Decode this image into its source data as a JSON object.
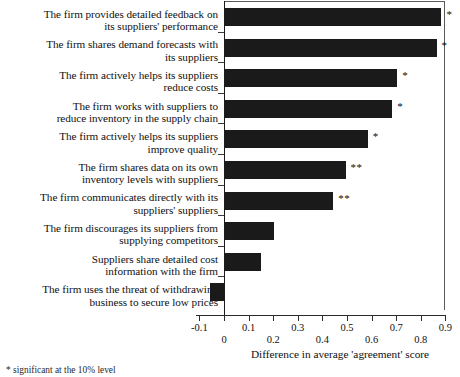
{
  "chart_data": {
    "type": "bar",
    "orientation": "horizontal",
    "title": "",
    "xlabel": "Difference in average 'agreement' score",
    "ylabel": "",
    "xlim": [
      -0.1,
      0.9
    ],
    "xticks": [
      -0.1,
      0,
      0.1,
      0.2,
      0.3,
      0.4,
      0.5,
      0.6,
      0.7,
      0.8,
      0.9
    ],
    "xticklabels": [
      "-0.1",
      "0",
      "0.1",
      "0.2",
      "0.3",
      "0.4",
      "0.5",
      "0.6",
      "0.7",
      "0.8",
      "0.9"
    ],
    "grid": false,
    "legend": null,
    "categories": [
      "The firm provides detailed feedback on its suppliers' performance",
      "The firm shares demand forecasts with its suppliers",
      "The firm actively helps its suppliers reduce costs",
      "The firm works with suppliers to reduce inventory in the supply chain",
      "The firm actively helps its suppliers improve quality",
      "The firm shares data on its own inventory levels with suppliers",
      "The firm communicates directly with its suppliers' suppliers",
      "The firm discourages its suppliers from supplying competitors",
      "Suppliers share detailed cost information with the firm",
      "The firm uses the threat of withdrawing business to secure low prices"
    ],
    "category_lines": [
      [
        "The firm provides detailed feedback on",
        "its suppliers' performance"
      ],
      [
        "The firm shares demand forecasts with",
        "its suppliers"
      ],
      [
        "The firm actively helps its suppliers",
        "reduce costs"
      ],
      [
        "The firm works with suppliers to",
        "reduce inventory in the supply chain"
      ],
      [
        "The firm actively helps its suppliers",
        "improve quality"
      ],
      [
        "The firm shares data on its own",
        "inventory levels with suppliers"
      ],
      [
        "The firm communicates directly with its",
        "suppliers' suppliers"
      ],
      [
        "The firm discourages its suppliers from",
        "supplying competitors"
      ],
      [
        "Suppliers share detailed cost",
        "information with the firm"
      ],
      [
        "The firm uses the threat of withdrawing",
        "business to secure low prices"
      ]
    ],
    "values": [
      0.88,
      0.86,
      0.7,
      0.68,
      0.58,
      0.49,
      0.44,
      0.2,
      0.145,
      -0.06
    ],
    "significance": [
      "*",
      "*",
      "*",
      "*",
      "*",
      "**",
      "**",
      "",
      "",
      ""
    ],
    "bar_color": "#1a1a1a"
  },
  "axis": {
    "xtitle": "Difference in average 'agreement' score"
  },
  "footnote": {
    "text": "* significant at the 10% level"
  }
}
